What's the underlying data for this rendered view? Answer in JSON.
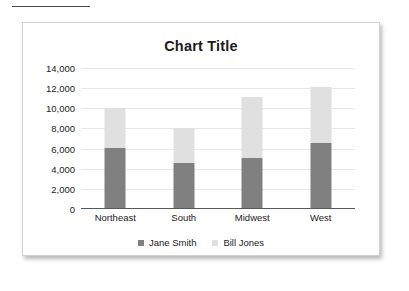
{
  "page": {
    "top_rule_name": "horizontal-rule"
  },
  "chart_data": {
    "type": "bar",
    "subtype": "stacked-bar",
    "title": "Chart Title",
    "xlabel": "",
    "ylabel": "",
    "ylim": [
      0,
      14000
    ],
    "ytick_step": 2000,
    "ytick_labels": [
      "14,000",
      "12,000",
      "10,000",
      "8,000",
      "6,000",
      "4,000",
      "2,000",
      "0"
    ],
    "ytick_values": [
      14000,
      12000,
      10000,
      8000,
      6000,
      4000,
      2000,
      0
    ],
    "grid": true,
    "legend_position": "bottom",
    "categories": [
      "Northeast",
      "South",
      "Midwest",
      "West"
    ],
    "series": [
      {
        "name": "Jane Smith",
        "color": "#808080",
        "values": [
          6100,
          4600,
          5100,
          6600
        ]
      },
      {
        "name": "Bill Jones",
        "color": "#e0e0e0",
        "values": [
          3900,
          3400,
          6000,
          5500
        ]
      }
    ],
    "totals": [
      10000,
      8000,
      11100,
      12100
    ]
  }
}
